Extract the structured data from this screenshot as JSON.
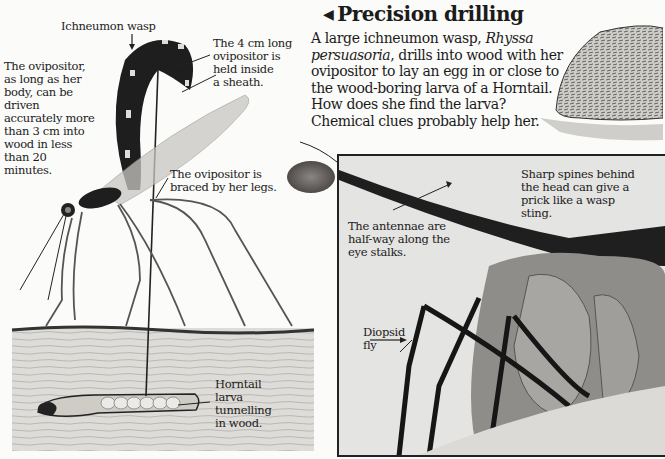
{
  "heading": {
    "arrow_glyph": "◀",
    "title": "Precision drilling"
  },
  "intro": {
    "part1": "A large ichneumon wasp, ",
    "species": "Rhyssa persuasoria",
    "part2": ", drills into wood with her ovipositor to lay an egg in or close to the wood-boring larva of a Horntail. How does she find the larva? Chemical clues probably help her."
  },
  "wasp_illustration": {
    "labels": {
      "wasp_name": "Ichneumon wasp",
      "ovipositor_length": [
        "The ovipositor,",
        "as long as her",
        "body, can be",
        "driven",
        "accurately more",
        "than 3 cm into",
        "wood in less",
        "than 20",
        "minutes."
      ],
      "sheath": [
        "The 4 cm long",
        "ovipositor is",
        "held inside",
        "a sheath."
      ],
      "braced": [
        "The ovipositor is",
        "braced by her legs."
      ],
      "larva": [
        "Horntail",
        "larva",
        "tunnelling",
        "in wood."
      ]
    }
  },
  "fly_photo": {
    "labels": {
      "spines": [
        "Sharp spines behind",
        "the head can give a",
        "prick like a wasp",
        "sting."
      ],
      "antennae": [
        "The antennae are",
        "half-way along the",
        "eye stalks."
      ],
      "fly_name": [
        "Diopsid",
        "fly"
      ]
    }
  },
  "colors": {
    "page": "#fbfbfa",
    "ink": "#1b1b1b",
    "wood": "#dcdad6",
    "photo_bg": "#e4e4e2"
  }
}
